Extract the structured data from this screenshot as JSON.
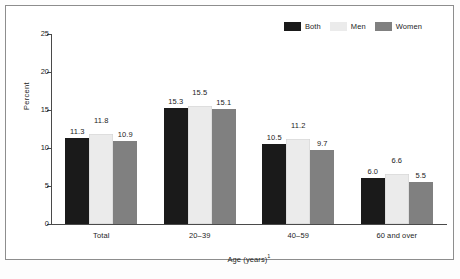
{
  "chart_data": {
    "type": "bar",
    "title": "",
    "subtitle": "",
    "xlabel": "Age (years)",
    "xlabel_footnote": "1",
    "ylabel": "Percent",
    "categories": [
      "Total",
      "20–39",
      "40–59",
      "60 and over"
    ],
    "series": [
      {
        "name": "Both",
        "color": "#1a1a1a",
        "values": [
          11.3,
          15.3,
          10.5,
          6.0
        ]
      },
      {
        "name": "Men",
        "color": "#ebebeb",
        "values": [
          11.8,
          15.5,
          11.2,
          6.6
        ]
      },
      {
        "name": "Women",
        "color": "#808080",
        "values": [
          10.9,
          15.1,
          9.7,
          5.5
        ]
      }
    ],
    "value_labels": [
      [
        "11.3",
        "11.8",
        "10.9"
      ],
      [
        "15.3",
        "15.5",
        "15.1"
      ],
      [
        "10.5",
        "11.2",
        "9.7"
      ],
      [
        "6.0",
        "6.6",
        "5.5"
      ]
    ],
    "ylim": [
      0,
      25
    ],
    "yticks": [
      0,
      5,
      10,
      15,
      20,
      25
    ],
    "ytick_labels": [
      "0",
      "5",
      "10",
      "15",
      "20",
      "25"
    ],
    "grid": false,
    "legend_position": "top-right",
    "legend": [
      "Both",
      "Men",
      "Women"
    ]
  },
  "legend": {
    "items": [
      {
        "label": "Both",
        "color": "#1a1a1a"
      },
      {
        "label": "Men",
        "color": "#ebebeb"
      },
      {
        "label": "Women",
        "color": "#808080"
      }
    ]
  },
  "axes": {
    "y": {
      "label": "Percent",
      "ticks": [
        "25",
        "20",
        "15",
        "10",
        "5",
        "0"
      ]
    },
    "x": {
      "label": "Age (years)",
      "footnote_marker": "1",
      "categories": [
        "Total",
        "20–39",
        "40–59",
        "60 and over"
      ]
    }
  },
  "colors": {
    "both": "#1a1a1a",
    "men": "#ebebeb",
    "women": "#808080",
    "axis": "#4a4a4a",
    "text": "#1d1d1d",
    "frame": "#8d8d8d",
    "page": "#fdfdfd"
  }
}
